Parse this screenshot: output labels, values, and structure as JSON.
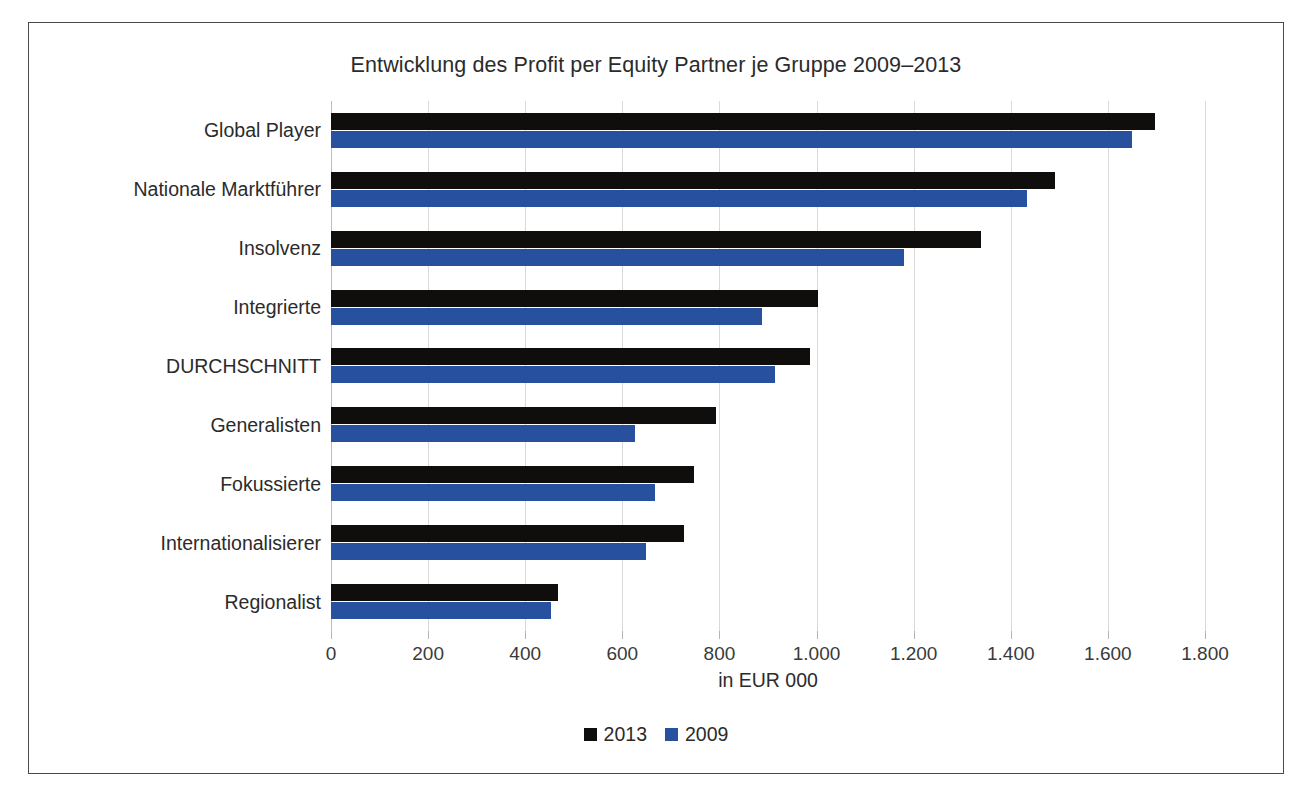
{
  "chart_data": {
    "type": "bar",
    "orientation": "horizontal",
    "title": "Entwicklung des Profit per Equity Partner je Gruppe 2009–2013",
    "xlabel": "in EUR 000",
    "ylabel": "",
    "xlim": [
      0,
      1800
    ],
    "xtick_step": 200,
    "xticks": [
      "0",
      "200",
      "400",
      "600",
      "800",
      "1.000",
      "1.200",
      "1.400",
      "1.600",
      "1.800"
    ],
    "xtick_values": [
      0,
      200,
      400,
      600,
      800,
      1000,
      1200,
      1400,
      1600,
      1800
    ],
    "grid": true,
    "grid_axis": "x",
    "legend_position": "bottom",
    "categories": [
      "Global Player",
      "Nationale Marktführer",
      "Insolvenz",
      "Integrierte",
      "DURCHSCHNITT",
      "Generalisten",
      "Fokussierte",
      "Internationalisierer",
      "Regionalist"
    ],
    "series": [
      {
        "name": "2013",
        "color": "#100d0d",
        "values": [
          1697,
          1491,
          1339,
          1003,
          986,
          792,
          747,
          726,
          467
        ]
      },
      {
        "name": "2009",
        "color": "#27509f",
        "values": [
          1650,
          1434,
          1181,
          888,
          914,
          627,
          668,
          648,
          453
        ]
      }
    ]
  }
}
